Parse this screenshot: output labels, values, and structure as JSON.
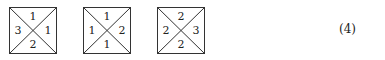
{
  "tiles": [
    {
      "top": "1",
      "left": "3",
      "right": "1",
      "bottom": "2"
    },
    {
      "top": "1",
      "left": "1",
      "right": "2",
      "bottom": "1"
    },
    {
      "top": "2",
      "left": "2",
      "right": "3",
      "bottom": "2"
    }
  ],
  "equation_number": "(4)"
}
